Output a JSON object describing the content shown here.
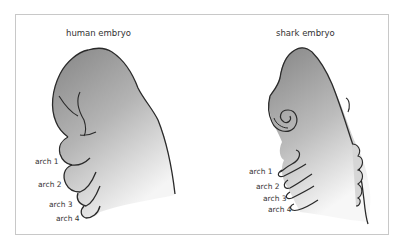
{
  "diagram": {
    "human": {
      "title": "human embryo",
      "arches": [
        "arch 1",
        "arch 2",
        "arch 3",
        "arch 4"
      ]
    },
    "shark": {
      "title": "shark embryo",
      "arches": [
        "arch 1",
        "arch 2",
        "arch 3",
        "arch 4"
      ]
    },
    "colors": {
      "body_dark": "#8a8a8a",
      "body_light": "#f4f4f4",
      "outline": "#2a2a2a",
      "frame": "#c8c8c8"
    }
  }
}
